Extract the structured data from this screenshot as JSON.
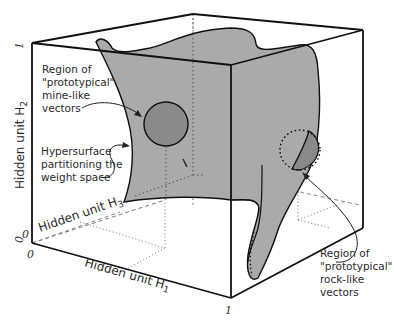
{
  "diagram": {
    "type": "3d-weight-space-cube",
    "colors": {
      "surface": "#aaaaaa",
      "circle_fill": "#8a8a8a",
      "edge": "#111111",
      "text": "#2a2a2a",
      "dashed": "#777777"
    },
    "axes": {
      "h1": {
        "label": "Hidden unit H",
        "subscript": "1",
        "tick_start": "0",
        "tick_end": "1"
      },
      "h2": {
        "label": "Hidden unit H",
        "subscript": "2",
        "tick_start": "0",
        "tick_end": "1"
      },
      "h3": {
        "label": "Hidden unit H",
        "subscript": "3",
        "tick_start": "0",
        "tick_end": "1"
      }
    },
    "annotations": {
      "mine": {
        "line1": "Region of",
        "line2": "\"prototypical\"",
        "line3": "mine-like",
        "line4": "vectors"
      },
      "hypersurface": {
        "line1": "Hypersurface",
        "line2": "partitioning the",
        "line3": "weight space"
      },
      "rock": {
        "line1": "Region of",
        "line2": "\"prototypical\"",
        "line3": "rock-like",
        "line4": "vectors"
      }
    }
  }
}
